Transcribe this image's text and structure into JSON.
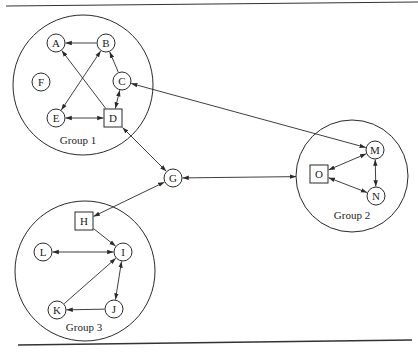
{
  "figure": {
    "groups": [
      {
        "id": "g1",
        "label": "Group 1",
        "cx": 83,
        "cy": 85,
        "r": 70,
        "lx": 78,
        "ly": 144
      },
      {
        "id": "g2",
        "label": "Group 2",
        "cx": 352,
        "cy": 176,
        "r": 56,
        "lx": 352,
        "ly": 219
      },
      {
        "id": "g3",
        "label": "Group 3",
        "cx": 85,
        "cy": 271,
        "r": 70,
        "lx": 84,
        "ly": 331
      }
    ],
    "nodes": [
      {
        "id": "A",
        "label": "A",
        "shape": "circle",
        "x": 56,
        "y": 43,
        "group": "Group 1"
      },
      {
        "id": "B",
        "label": "B",
        "shape": "circle",
        "x": 106,
        "y": 43,
        "group": "Group 1"
      },
      {
        "id": "F",
        "label": "F",
        "shape": "circle",
        "x": 41,
        "y": 82,
        "group": "Group 1"
      },
      {
        "id": "C",
        "label": "C",
        "shape": "circle",
        "x": 122,
        "y": 81,
        "group": "Group 1"
      },
      {
        "id": "E",
        "label": "E",
        "shape": "circle",
        "x": 56,
        "y": 118,
        "group": "Group 1"
      },
      {
        "id": "D",
        "label": "D",
        "shape": "square",
        "x": 113,
        "y": 118,
        "group": "Group 1"
      },
      {
        "id": "G",
        "label": "G",
        "shape": "circle",
        "x": 173,
        "y": 178,
        "group": null
      },
      {
        "id": "M",
        "label": "M",
        "shape": "circle",
        "x": 375,
        "y": 150,
        "group": "Group 2"
      },
      {
        "id": "O",
        "label": "O",
        "shape": "square",
        "x": 319,
        "y": 174,
        "group": "Group 2"
      },
      {
        "id": "N",
        "label": "N",
        "shape": "circle",
        "x": 376,
        "y": 196,
        "group": "Group 2"
      },
      {
        "id": "H",
        "label": "H",
        "shape": "square",
        "x": 84,
        "y": 221,
        "group": "Group 3"
      },
      {
        "id": "L",
        "label": "L",
        "shape": "circle",
        "x": 43,
        "y": 252,
        "group": "Group 3"
      },
      {
        "id": "I",
        "label": "I",
        "shape": "circle",
        "x": 123,
        "y": 252,
        "group": "Group 3"
      },
      {
        "id": "K",
        "label": "K",
        "shape": "circle",
        "x": 57,
        "y": 310,
        "group": "Group 3"
      },
      {
        "id": "J",
        "label": "J",
        "shape": "circle",
        "x": 114,
        "y": 309,
        "group": "Group 3"
      }
    ],
    "edges": [
      {
        "from": "B",
        "to": "A",
        "direction": "forward"
      },
      {
        "from": "D",
        "to": "A",
        "direction": "forward"
      },
      {
        "from": "E",
        "to": "B",
        "direction": "both"
      },
      {
        "from": "C",
        "to": "B",
        "direction": "forward"
      },
      {
        "from": "D",
        "to": "C",
        "direction": "both"
      },
      {
        "from": "D",
        "to": "E",
        "direction": "both"
      },
      {
        "from": "C",
        "to": "M",
        "direction": "both"
      },
      {
        "from": "D",
        "to": "G",
        "direction": "both"
      },
      {
        "from": "H",
        "to": "G",
        "direction": "both"
      },
      {
        "from": "G",
        "to": "g2",
        "direction": "both"
      },
      {
        "from": "O",
        "to": "M",
        "direction": "both"
      },
      {
        "from": "O",
        "to": "N",
        "direction": "both"
      },
      {
        "from": "M",
        "to": "N",
        "direction": "both"
      },
      {
        "from": "H",
        "to": "I",
        "direction": "forward"
      },
      {
        "from": "L",
        "to": "I",
        "direction": "both"
      },
      {
        "from": "K",
        "to": "I",
        "direction": "forward"
      },
      {
        "from": "I",
        "to": "J",
        "direction": "both"
      },
      {
        "from": "J",
        "to": "K",
        "direction": "forward"
      }
    ],
    "rules": {
      "top": {
        "x1": 6,
        "y1": 6,
        "x2": 418,
        "y2": 2
      },
      "bottom": {
        "x1": 18,
        "y1": 345,
        "x2": 412,
        "y2": 340
      }
    },
    "colors": {
      "stroke": "#2a2a2a",
      "background": "#ffffff"
    }
  }
}
